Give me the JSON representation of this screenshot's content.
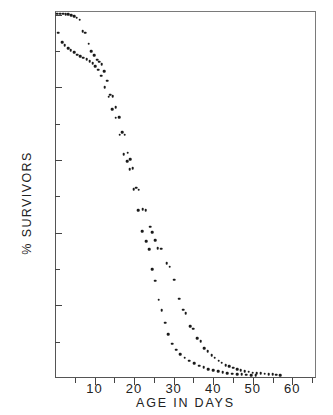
{
  "chart_data": {
    "type": "scatter",
    "title": "",
    "xlabel": "AGE IN DAYS",
    "ylabel": "% SURVIVORS",
    "xlim": [
      0,
      66
    ],
    "ylim": [
      0,
      101
    ],
    "grid": false,
    "legend_position": "none",
    "x_ticks_major": [
      10,
      20,
      30,
      40,
      50,
      60
    ],
    "x_ticks_minor": [
      5,
      15,
      25,
      35,
      45,
      55,
      65
    ],
    "y_ticks_major": [
      20,
      40,
      60,
      80,
      100
    ],
    "y_ticks_minor": [
      10,
      30,
      50,
      70,
      90
    ],
    "x_tick_labels": [
      "10",
      "20",
      "30",
      "40",
      "50",
      "60"
    ],
    "y_tick_labels": [
      "20",
      "40",
      "60",
      "80",
      "100"
    ],
    "marker": "filled-circle",
    "marker_color": "#1a1a1a",
    "series": [
      {
        "name": "upper-cohort",
        "points": [
          [
            0.6,
            100.3
          ],
          [
            1.3,
            100.3
          ],
          [
            2.0,
            100.3
          ],
          [
            2.7,
            100.2
          ],
          [
            3.4,
            100.1
          ],
          [
            4.1,
            99.9
          ],
          [
            4.8,
            99.6
          ],
          [
            5.5,
            99.2
          ],
          [
            6.2,
            98.6
          ],
          [
            7.0,
            95.4
          ],
          [
            7.6,
            95.0
          ],
          [
            8.5,
            92.0
          ],
          [
            9.2,
            90.0
          ],
          [
            9.9,
            88.8
          ],
          [
            10.6,
            87.6
          ],
          [
            11.2,
            87.0
          ],
          [
            11.8,
            86.4
          ],
          [
            12.5,
            84.5
          ],
          [
            13.2,
            81.8
          ],
          [
            14.0,
            78.0
          ],
          [
            14.6,
            77.6
          ],
          [
            15.4,
            74.6
          ],
          [
            16.2,
            71.8
          ],
          [
            17.0,
            67.6
          ],
          [
            17.6,
            67.0
          ],
          [
            18.4,
            62.0
          ],
          [
            19.0,
            60.2
          ],
          [
            19.6,
            57.8
          ],
          [
            20.6,
            52.4
          ],
          [
            21.2,
            51.8
          ],
          [
            22.2,
            46.4
          ],
          [
            22.9,
            46.2
          ],
          [
            24.0,
            41.6
          ],
          [
            24.6,
            40.2
          ],
          [
            25.4,
            38.0
          ],
          [
            26.0,
            35.8
          ],
          [
            26.8,
            35.6
          ],
          [
            28.2,
            31.6
          ],
          [
            29.0,
            30.6
          ],
          [
            30.2,
            27.0
          ],
          [
            31.4,
            21.8
          ],
          [
            32.4,
            18.8
          ],
          [
            33.0,
            17.8
          ],
          [
            34.2,
            14.2
          ],
          [
            34.9,
            13.6
          ],
          [
            36.0,
            11.0
          ],
          [
            36.8,
            10.2
          ],
          [
            37.8,
            8.2
          ],
          [
            38.6,
            7.4
          ],
          [
            39.6,
            6.2
          ],
          [
            40.4,
            5.6
          ],
          [
            41.4,
            4.8
          ],
          [
            42.2,
            4.2
          ],
          [
            43.2,
            3.6
          ],
          [
            44.0,
            3.2
          ],
          [
            45.0,
            2.8
          ],
          [
            46.0,
            2.4
          ],
          [
            47.0,
            2.1
          ],
          [
            48.0,
            1.9
          ],
          [
            49.0,
            1.7
          ],
          [
            50.0,
            1.5
          ],
          [
            51.0,
            1.4
          ],
          [
            52.0,
            1.3
          ],
          [
            53.0,
            1.2
          ],
          [
            54.0,
            1.1
          ],
          [
            55.0,
            1.0
          ],
          [
            56.0,
            0.9
          ],
          [
            57.0,
            0.8
          ]
        ]
      },
      {
        "name": "lower-cohort",
        "points": [
          [
            0.8,
            95.0
          ],
          [
            1.8,
            92.4
          ],
          [
            2.5,
            91.6
          ],
          [
            3.3,
            90.8
          ],
          [
            4.0,
            90.2
          ],
          [
            4.8,
            89.6
          ],
          [
            5.6,
            89.0
          ],
          [
            6.4,
            88.6
          ],
          [
            7.2,
            88.2
          ],
          [
            8.0,
            87.8
          ],
          [
            8.8,
            87.2
          ],
          [
            9.5,
            86.6
          ],
          [
            10.2,
            85.8
          ],
          [
            10.9,
            84.8
          ],
          [
            11.7,
            83.2
          ],
          [
            12.6,
            80.0
          ],
          [
            13.6,
            77.4
          ],
          [
            14.4,
            74.0
          ],
          [
            15.4,
            71.6
          ],
          [
            16.4,
            67.0
          ],
          [
            17.4,
            61.6
          ],
          [
            18.2,
            59.6
          ],
          [
            18.9,
            57.4
          ],
          [
            19.9,
            52.0
          ],
          [
            21.0,
            46.2
          ],
          [
            22.0,
            40.4
          ],
          [
            23.0,
            37.6
          ],
          [
            23.8,
            35.4
          ],
          [
            24.6,
            30.0
          ],
          [
            25.4,
            26.8
          ],
          [
            26.2,
            21.6
          ],
          [
            27.0,
            18.6
          ],
          [
            27.8,
            15.2
          ],
          [
            28.6,
            12.0
          ],
          [
            29.6,
            9.4
          ],
          [
            30.6,
            7.8
          ],
          [
            31.6,
            6.6
          ],
          [
            32.8,
            5.6
          ],
          [
            34.0,
            4.8
          ],
          [
            35.2,
            4.0
          ],
          [
            36.4,
            3.4
          ],
          [
            37.6,
            2.9
          ],
          [
            38.8,
            2.5
          ],
          [
            40.0,
            2.1
          ],
          [
            41.2,
            1.8
          ],
          [
            42.4,
            1.6
          ],
          [
            43.6,
            1.4
          ],
          [
            44.8,
            1.2
          ],
          [
            46.0,
            1.1
          ],
          [
            47.2,
            1.0
          ],
          [
            48.4,
            0.9
          ],
          [
            49.6,
            0.85
          ],
          [
            50.8,
            0.8
          ]
        ]
      }
    ]
  }
}
